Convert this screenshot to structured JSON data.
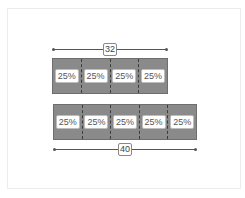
{
  "diagram": {
    "top": {
      "dimension_label": "32",
      "segments": [
        "25%",
        "25%",
        "25%",
        "25%"
      ]
    },
    "bottom": {
      "dimension_label": "40",
      "segments": [
        "25%",
        "25%",
        "25%",
        "25%",
        "25%"
      ]
    },
    "colors": {
      "bar_fill": "#8a8a8a",
      "divider": "#3a3a3a",
      "label_bg": "#ffffff"
    }
  }
}
